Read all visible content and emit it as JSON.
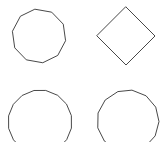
{
  "canvas": {
    "width": 163,
    "height": 142,
    "background_color": "#ffffff",
    "stroke_color": "#333333",
    "stroke_width": 0.9,
    "description": "Four regular polygon outlines arranged in a two by two grid"
  },
  "chart_data": {
    "type": "scatter",
    "title": "",
    "subtitle": "",
    "xlabel": "",
    "ylabel": "",
    "grid": false,
    "legend": null,
    "xlim": [
      0,
      163
    ],
    "ylim": [
      0,
      142
    ],
    "shapes": [
      {
        "name": "decagon",
        "position": "top-left",
        "sides": 10,
        "center_x": 39,
        "center_y": 36,
        "radius": 27,
        "rotation_deg": -8,
        "clipped": false,
        "fill": "none",
        "stroke": "#333333"
      },
      {
        "name": "diamond",
        "position": "top-right",
        "sides": 4,
        "center_x": 126,
        "center_y": 36,
        "radius": 29,
        "rotation_deg": 0,
        "clipped": false,
        "fill": "none",
        "stroke": "#333333"
      },
      {
        "name": "hexadecagon",
        "position": "bottom-left",
        "sides": 16,
        "center_x": 40,
        "center_y": 122,
        "radius": 32,
        "rotation_deg": 11,
        "clipped": true,
        "fill": "none",
        "stroke": "#333333"
      },
      {
        "name": "tridecagon",
        "position": "bottom-right",
        "sides": 13,
        "center_x": 128,
        "center_y": 121,
        "radius": 31,
        "rotation_deg": 8,
        "clipped": true,
        "fill": "none",
        "stroke": "#333333"
      }
    ]
  }
}
